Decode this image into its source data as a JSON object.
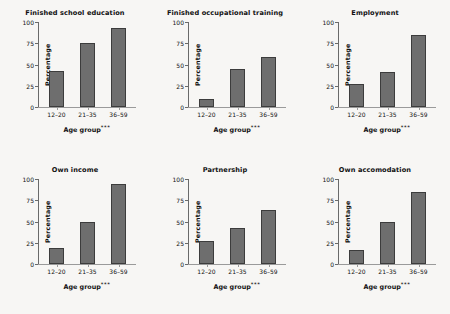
{
  "figure": {
    "layout": "2 rows x 3 columns of bar charts",
    "background_color": "#f7f6f4",
    "bar_color": "#6e6e6e",
    "bar_edge_color": "#3c3c3c"
  },
  "axis": {
    "ylabel": "Percentage",
    "xlabel_text": "Age group",
    "xlabel_significance": "***",
    "ytick_labels": [
      "0",
      "25",
      "50",
      "75",
      "100"
    ],
    "ytick_values": [
      0,
      25,
      50,
      75,
      100
    ],
    "xtick_labels": [
      "12–20",
      "21–35",
      "36–59"
    ]
  },
  "chart_data": [
    {
      "type": "bar",
      "title": "Finished school education",
      "categories": [
        "12–20",
        "21–35",
        "36–59"
      ],
      "values": [
        42,
        75,
        93
      ],
      "xlabel": "Age group***",
      "ylabel": "Percentage",
      "ylim": [
        0,
        100
      ],
      "grid": false,
      "legend": "none"
    },
    {
      "type": "bar",
      "title": "Finished occupational training",
      "categories": [
        "12–20",
        "21–35",
        "36–59"
      ],
      "values": [
        10,
        45,
        59
      ],
      "xlabel": "Age group***",
      "ylabel": "Percentage",
      "ylim": [
        0,
        100
      ],
      "grid": false,
      "legend": "none"
    },
    {
      "type": "bar",
      "title": "Employment",
      "categories": [
        "12–20",
        "21–35",
        "36–59"
      ],
      "values": [
        27,
        41,
        85
      ],
      "xlabel": "Age group***",
      "ylabel": "Percentage",
      "ylim": [
        0,
        100
      ],
      "grid": false,
      "legend": "none"
    },
    {
      "type": "bar",
      "title": "Own income",
      "categories": [
        "12–20",
        "21–35",
        "36–59"
      ],
      "values": [
        19,
        49,
        94
      ],
      "xlabel": "Age group***",
      "ylabel": "Percentage",
      "ylim": [
        0,
        100
      ],
      "grid": false,
      "legend": "none"
    },
    {
      "type": "bar",
      "title": "Partnership",
      "categories": [
        "12–20",
        "21–35",
        "36–59"
      ],
      "values": [
        27,
        42,
        64
      ],
      "xlabel": "Age group***",
      "ylabel": "Percentage",
      "ylim": [
        0,
        100
      ],
      "grid": false,
      "legend": "none"
    },
    {
      "type": "bar",
      "title": "Own accomodation",
      "categories": [
        "12–20",
        "21–35",
        "36–59"
      ],
      "values": [
        16,
        49,
        85
      ],
      "xlabel": "Age group***",
      "ylabel": "Percentage",
      "ylim": [
        0,
        100
      ],
      "grid": false,
      "legend": "none"
    }
  ]
}
